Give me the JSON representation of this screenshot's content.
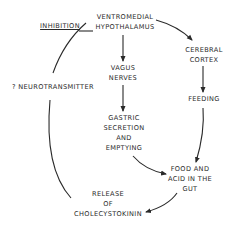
{
  "diagram": {
    "nodes": {
      "vmh": {
        "line1": "VENTROMEDIAL",
        "line2": "HYPOTHALAMUS"
      },
      "vagus": {
        "line1": "VAGUS",
        "line2": "NERVES"
      },
      "gastric": {
        "line1": "GASTRIC",
        "line2": "SECRETION",
        "line3": "AND",
        "line4": "EMPTYING"
      },
      "cortex": {
        "line1": "CEREBRAL",
        "line2": "CORTEX"
      },
      "feeding": {
        "line1": "FEEDING"
      },
      "food": {
        "line1": "FOOD AND",
        "line2": "ACID IN THE",
        "line3": "GUT"
      },
      "cck": {
        "line1": "RELEASE",
        "line2": "OF",
        "line3": "CHOLECYSTOKININ"
      },
      "neuro": {
        "line1": "? NEUROTRANSMITTER"
      },
      "inhibition": {
        "line1": "INHIBITION"
      }
    },
    "edges": [
      {
        "from": "VENTROMEDIAL HYPOTHALAMUS",
        "to": "VAGUS NERVES"
      },
      {
        "from": "VAGUS NERVES",
        "to": "GASTRIC SECRETION AND EMPTYING"
      },
      {
        "from": "GASTRIC SECRETION AND EMPTYING",
        "to": "FOOD AND ACID IN THE GUT"
      },
      {
        "from": "VENTROMEDIAL HYPOTHALAMUS",
        "to": "CEREBRAL CORTEX"
      },
      {
        "from": "CEREBRAL CORTEX",
        "to": "FEEDING"
      },
      {
        "from": "FEEDING",
        "to": "FOOD AND ACID IN THE GUT"
      },
      {
        "from": "FOOD AND ACID IN THE GUT",
        "to": "RELEASE OF CHOLECYSTOKININ"
      },
      {
        "from": "RELEASE OF CHOLECYSTOKININ",
        "to": "VENTROMEDIAL HYPOTHALAMUS",
        "via": "? NEUROTRANSMITTER",
        "label": "INHIBITION"
      }
    ],
    "colors": {
      "ink": "#2a2a2a",
      "background": "#ffffff"
    }
  }
}
